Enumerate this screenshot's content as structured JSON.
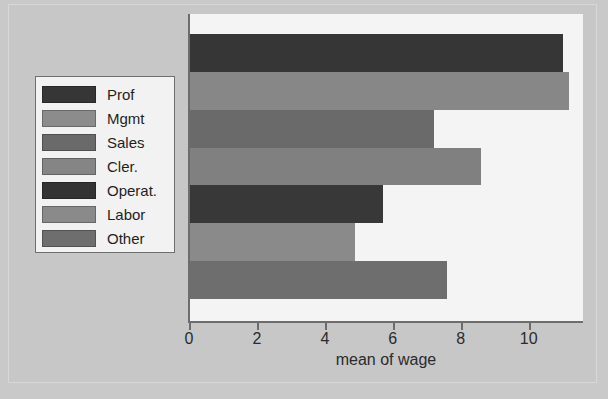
{
  "chart_data": {
    "type": "bar",
    "orientation": "horizontal",
    "title": "",
    "xlabel": "mean of wage",
    "ylabel": "",
    "categories": [
      "Prof",
      "Mgmt",
      "Sales",
      "Cler.",
      "Operat.",
      "Labor",
      "Other"
    ],
    "values": [
      11.0,
      11.2,
      7.2,
      8.6,
      5.7,
      4.9,
      7.6
    ],
    "xlim": [
      0,
      11.6
    ],
    "xticks": [
      0,
      2,
      4,
      6,
      8,
      10
    ],
    "xticklabels": [
      "0",
      "2",
      "4",
      "6",
      "8",
      "10"
    ],
    "grid": false,
    "legend_position": "left-outside",
    "series": [
      {
        "name": "mean of wage",
        "points": [
          {
            "category": "Prof",
            "value": 11.0,
            "color": "#363636"
          },
          {
            "category": "Mgmt",
            "value": 11.2,
            "color": "#878787"
          },
          {
            "category": "Sales",
            "value": 7.2,
            "color": "#6a6a6a"
          },
          {
            "category": "Cler.",
            "value": 8.6,
            "color": "#808080"
          },
          {
            "category": "Operat.",
            "value": 5.7,
            "color": "#383838"
          },
          {
            "category": "Labor",
            "value": 4.9,
            "color": "#8a8a8a"
          },
          {
            "category": "Other",
            "value": 7.6,
            "color": "#6e6e6e"
          }
        ]
      }
    ]
  },
  "legend": {
    "items": [
      {
        "label": "Prof",
        "color": "#363636"
      },
      {
        "label": "Mgmt",
        "color": "#8c8c8c"
      },
      {
        "label": "Sales",
        "color": "#6a6a6a"
      },
      {
        "label": "Cler.",
        "color": "#858585"
      },
      {
        "label": "Operat.",
        "color": "#333333"
      },
      {
        "label": "Labor",
        "color": "#8a8a8a"
      },
      {
        "label": "Other",
        "color": "#6e6e6e"
      }
    ]
  },
  "colors": {
    "canvas": "#c7c7c7",
    "panel": "#f4f4f4",
    "axis": "#6d6d6d",
    "text": "#2b2b2b",
    "legend_background": "#f2f2f2",
    "legend_border": "#6f6f6f"
  }
}
